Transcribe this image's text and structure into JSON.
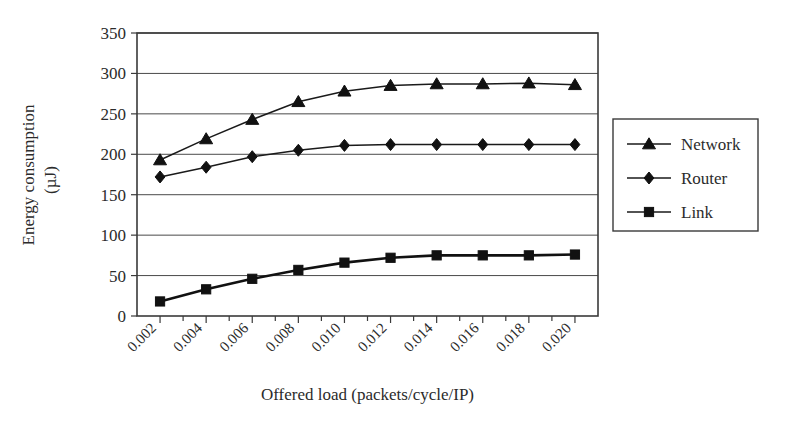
{
  "chart_data": {
    "type": "line",
    "title": "",
    "xlabel": "Offered load (packets/cycle/IP)",
    "ylabel": "Energy consumption (µJ)",
    "ylabel_line1": "Energy consumption",
    "ylabel_line2": "(µJ)",
    "x": [
      0.002,
      0.004,
      0.006,
      0.008,
      0.01,
      0.012,
      0.014,
      0.016,
      0.018,
      0.02
    ],
    "xtick_labels": [
      "0.002",
      "0.004",
      "0.006",
      "0.008",
      "0.010",
      "0.012",
      "0.014",
      "0.016",
      "0.018",
      "0.020"
    ],
    "ytick_labels": [
      "0",
      "50",
      "100",
      "150",
      "200",
      "250",
      "300",
      "350"
    ],
    "yticks": [
      0,
      50,
      100,
      150,
      200,
      250,
      300,
      350
    ],
    "ylim": [
      0,
      350
    ],
    "xlim": [
      0.001,
      0.021
    ],
    "grid": "horizontal",
    "legend_position": "right",
    "series": [
      {
        "name": "Network",
        "marker": "triangle",
        "color": "#111111",
        "values": [
          193,
          219,
          243,
          265,
          278,
          285,
          287,
          287,
          288,
          286
        ]
      },
      {
        "name": "Router",
        "marker": "diamond",
        "color": "#111111",
        "values": [
          172,
          184,
          197,
          205,
          211,
          212,
          212,
          212,
          212,
          212
        ]
      },
      {
        "name": "Link",
        "marker": "square",
        "color": "#111111",
        "values": [
          18,
          33,
          46,
          57,
          66,
          72,
          75,
          75,
          75,
          76
        ]
      }
    ]
  }
}
